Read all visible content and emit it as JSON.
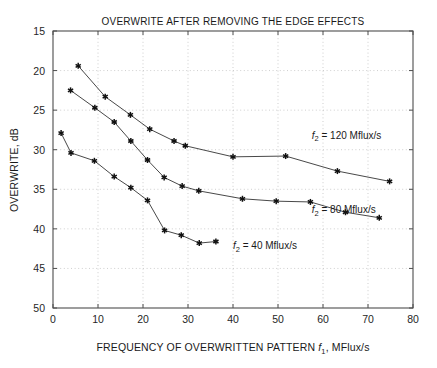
{
  "chart_data": {
    "type": "line",
    "title": "OVERWRITE AFTER REMOVING THE EDGE EFFECTS",
    "xlabel": "FREQUENCY OF OVERWRITTEN PATTERN f1, MFlux/s",
    "ylabel": "OVERWRITE, dB",
    "xlim": [
      0,
      80
    ],
    "ylim": [
      15,
      50
    ],
    "y_inverted": true,
    "grid": true,
    "legend_position": "inline-annotations",
    "xticks": [
      0,
      10,
      20,
      30,
      40,
      50,
      60,
      70,
      80
    ],
    "yticks": [
      15,
      20,
      25,
      30,
      35,
      40,
      45,
      50
    ],
    "marker": "asterisk-star",
    "line_color": "#333333",
    "marker_color": "#111111",
    "series": [
      {
        "name": "f2 = 120 Mflux/s",
        "label_text": "f",
        "label_sub": "2",
        "label_rest": " = 120 Mflux/s",
        "label_x": 57.5,
        "label_y": 28.6,
        "x": [
          5.6,
          11.6,
          17.2,
          21.5,
          26.9,
          29.4,
          40.0,
          51.7,
          63.2,
          74.8
        ],
        "y": [
          19.4,
          23.3,
          25.6,
          27.4,
          28.9,
          29.5,
          30.9,
          30.8,
          32.7,
          34.0
        ]
      },
      {
        "name": "f2 = 80 Mflux/s",
        "label_text": "f",
        "label_sub": "2",
        "label_rest": " = 80 Mflux/s",
        "label_x": 57.5,
        "label_y": 38.0,
        "x": [
          3.9,
          9.3,
          13.6,
          17.3,
          21.0,
          24.7,
          28.7,
          32.4,
          42.1,
          49.6,
          57.2,
          65.0,
          72.5
        ],
        "y": [
          22.5,
          24.7,
          26.5,
          28.9,
          31.3,
          33.5,
          34.6,
          35.2,
          36.2,
          36.5,
          36.6,
          37.9,
          38.6
        ]
      },
      {
        "name": "f2 = 40 Mflux/s",
        "label_text": "f",
        "label_sub": "2",
        "label_rest": " = 40 Mflux/s",
        "label_x": 40.0,
        "label_y": 42.6,
        "x": [
          1.8,
          4.0,
          9.2,
          13.6,
          17.3,
          21.0,
          24.8,
          28.5,
          32.5,
          36.2
        ],
        "y": [
          27.9,
          30.4,
          31.4,
          33.4,
          34.8,
          36.4,
          40.2,
          40.8,
          41.8,
          41.6
        ]
      }
    ]
  },
  "axis": {
    "x_tick_labels": [
      "0",
      "10",
      "20",
      "30",
      "40",
      "50",
      "60",
      "70",
      "80"
    ],
    "y_tick_labels": [
      "15",
      "20",
      "25",
      "30",
      "35",
      "40",
      "45",
      "50"
    ],
    "x_title_prefix": "FREQUENCY OF OVERWRITTEN PATTERN ",
    "x_title_var": "f",
    "x_title_sub": "1",
    "x_title_suffix": ", MFlux/s",
    "y_title": "OVERWRITE, dB"
  }
}
